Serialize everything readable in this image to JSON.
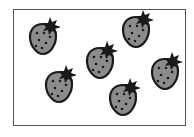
{
  "scene": {
    "description": "Six strawberries inside a rectangular frame",
    "count": 6,
    "colors": {
      "body": "#8c8c8c",
      "outline": "#1a1a1a",
      "leaves": "#1a1a1a",
      "seeds": "#1a1a1a",
      "frame": "#555555",
      "background": "#ffffff"
    },
    "strawberries": [
      {
        "id": 1,
        "x": 28,
        "y": 16
      },
      {
        "id": 2,
        "x": 44,
        "y": 64
      },
      {
        "id": 3,
        "x": 85,
        "y": 40
      },
      {
        "id": 4,
        "x": 121,
        "y": 9
      },
      {
        "id": 5,
        "x": 108,
        "y": 77
      },
      {
        "id": 6,
        "x": 150,
        "y": 51
      }
    ]
  }
}
